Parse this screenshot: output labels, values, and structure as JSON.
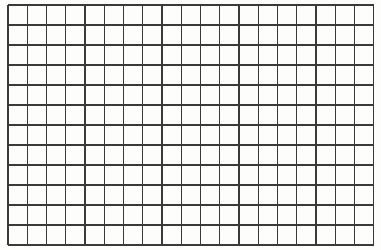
{
  "document": {
    "title": "Blank grid",
    "type": "graph-paper-grid",
    "background_color": "#ffffff",
    "paper_tone_color": "#fdfdfc"
  },
  "chart_data": {
    "type": "table",
    "title": "",
    "subtitle": "",
    "xlabel": "",
    "ylabel": "",
    "grid": {
      "columns": 19,
      "rows": 12,
      "vertical_lines": 20,
      "horizontal_lines": 13,
      "origin_x": 8,
      "origin_y": 5,
      "cell_width": 19.25,
      "cell_height": 20.0,
      "width": 365.75,
      "height": 240.0,
      "line_color": "#3a3a3a",
      "line_width": 1.4,
      "border_color": "#3a3a3a",
      "border_width": 1.4,
      "grid_on": true
    },
    "categories": [],
    "values": [],
    "series": [],
    "legend": {
      "visible": false,
      "position": "none",
      "entries": []
    },
    "annotations": [],
    "tick_labels": {
      "x": [],
      "y": []
    },
    "xlim": [
      0,
      19
    ],
    "ylim": [
      0,
      12
    ]
  }
}
